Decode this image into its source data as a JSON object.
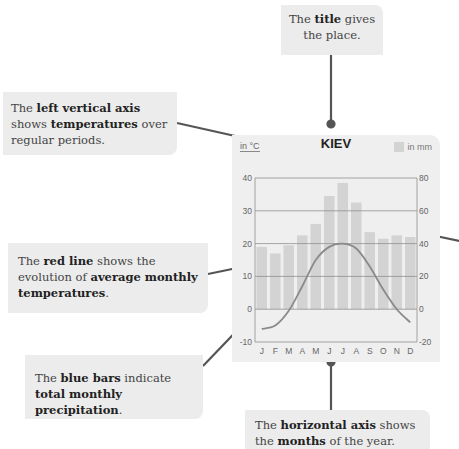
{
  "callouts": {
    "title": {
      "parts": [
        {
          "text": "The ",
          "bold": false
        },
        {
          "text": "title",
          "bold": true
        },
        {
          "text": " gives the place.",
          "bold": false
        }
      ]
    },
    "left_axis": {
      "parts": [
        {
          "text": "The ",
          "bold": false
        },
        {
          "text": "left vertical axis",
          "bold": true
        },
        {
          "text": " shows ",
          "bold": false
        },
        {
          "text": "temperatures",
          "bold": true
        },
        {
          "text": " over regular periods.",
          "bold": false
        }
      ]
    },
    "red_line": {
      "parts": [
        {
          "text": "The ",
          "bold": false
        },
        {
          "text": "red line",
          "bold": true
        },
        {
          "text": " shows the evolution of ",
          "bold": false
        },
        {
          "text": "average monthly temperatures",
          "bold": true
        },
        {
          "text": ".",
          "bold": false
        }
      ]
    },
    "blue_bars": {
      "parts": [
        {
          "text": "The ",
          "bold": false
        },
        {
          "text": "blue bars",
          "bold": true
        },
        {
          "text": " indicate ",
          "bold": false
        },
        {
          "text": "total monthly precipitation",
          "bold": true
        },
        {
          "text": ".",
          "bold": false
        }
      ]
    },
    "horizontal_axis": {
      "parts": [
        {
          "text": "The ",
          "bold": false
        },
        {
          "text": "horizontal axis",
          "bold": true
        },
        {
          "text": " shows the ",
          "bold": false
        },
        {
          "text": "months",
          "bold": true
        },
        {
          "text": " of the year.",
          "bold": false
        }
      ]
    }
  },
  "chart": {
    "title": "KIEV",
    "left_unit": "in °C",
    "right_unit": "in mm",
    "colors": {
      "card_bg": "#efefef",
      "bars": "#d3d3d3",
      "line": "#8a8a8a",
      "grid": "#8f8f8f",
      "connector": "#555555"
    }
  },
  "chart_data": {
    "type": "bar",
    "title": "KIEV",
    "categories": [
      "J",
      "F",
      "M",
      "A",
      "M",
      "J",
      "J",
      "A",
      "S",
      "O",
      "N",
      "D"
    ],
    "series": [
      {
        "name": "Precipitation (in mm)",
        "type": "bar",
        "axis": "right",
        "values": [
          38,
          34,
          39,
          45,
          52,
          69,
          77,
          65,
          47,
          43,
          45,
          44
        ]
      },
      {
        "name": "Average temperature (in °C)",
        "type": "line",
        "axis": "left",
        "values": [
          -6,
          -5,
          -0.5,
          7,
          15,
          19,
          20,
          18.5,
          13,
          6,
          0,
          -4
        ]
      }
    ],
    "left_axis": {
      "label": "in °C",
      "ticks": [
        40,
        30,
        20,
        10,
        0,
        -10
      ],
      "range": [
        -10,
        40
      ]
    },
    "right_axis": {
      "label": "in mm",
      "ticks": [
        80,
        60,
        40,
        20,
        0,
        -20
      ],
      "range": [
        -20,
        80
      ]
    },
    "xlabel": "",
    "grid": true,
    "legend": {
      "position": "top-right",
      "entries": [
        "in mm"
      ]
    }
  }
}
